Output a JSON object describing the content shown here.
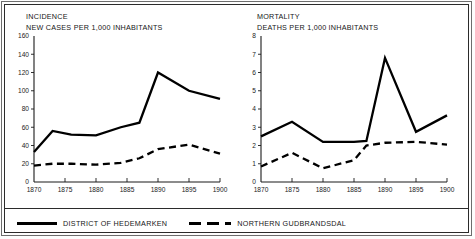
{
  "figure": {
    "legend": {
      "series": [
        {
          "key": "hedemarken",
          "label": "DISTRICT OF HEDEMARKEN",
          "style": "solid"
        },
        {
          "key": "gudbrandsdal",
          "label": "NORTHERN GUDBRANDSDAL",
          "style": "dashed"
        }
      ]
    }
  },
  "chart_data": [
    {
      "id": "incidence",
      "type": "line",
      "title": "INCIDENCE",
      "subtitle": "NEW CASES PER 1,000 INHABITANTS",
      "xlabel": "",
      "ylabel": "NEW CASES PER 1,000 INHABITANTS",
      "grid": false,
      "legend_position": "bottom",
      "xlim": [
        1870,
        1900
      ],
      "ylim": [
        0,
        160
      ],
      "xticks": [
        1870,
        1875,
        1880,
        1885,
        1890,
        1895,
        1900
      ],
      "yticks": [
        0,
        20,
        40,
        60,
        80,
        100,
        120,
        140,
        160
      ],
      "xticklabels": [
        "1870",
        "1875",
        "1880",
        "1885",
        "1890",
        "1895",
        "1900"
      ],
      "yticklabels": [
        "0",
        "20",
        "40",
        "60",
        "80",
        "100",
        "120",
        "140",
        "160"
      ],
      "x": [
        1870,
        1873,
        1876,
        1880,
        1884,
        1887,
        1890,
        1895,
        1900
      ],
      "series": [
        {
          "name": "DISTRICT OF HEDEMARKEN",
          "style": "solid",
          "values": [
            33,
            56,
            52,
            51,
            60,
            65,
            120,
            100,
            91
          ]
        },
        {
          "name": "NORTHERN GUDBRANDSDAL",
          "style": "dashed",
          "values": [
            18,
            20,
            20,
            19,
            21,
            26,
            36,
            41,
            31
          ]
        }
      ]
    },
    {
      "id": "mortality",
      "type": "line",
      "title": "MORTALITY",
      "subtitle": "DEATHS PER 1,000 INHABITANTS",
      "xlabel": "",
      "ylabel": "DEATHS PER 1,000 INHABITANTS",
      "grid": false,
      "legend_position": "bottom",
      "xlim": [
        1870,
        1900
      ],
      "ylim": [
        0,
        8
      ],
      "xticks": [
        1870,
        1875,
        1880,
        1885,
        1890,
        1895,
        1900
      ],
      "yticks": [
        0,
        1,
        2,
        3,
        4,
        5,
        6,
        7,
        8
      ],
      "xticklabels": [
        "1870",
        "1875",
        "1880",
        "1885",
        "1890",
        "1895",
        "1900"
      ],
      "yticklabels": [
        "0",
        "1",
        "2",
        "3",
        "4",
        "5",
        "6",
        "7",
        "8"
      ],
      "x": [
        1870,
        1875,
        1880,
        1885,
        1887,
        1890,
        1895,
        1900
      ],
      "series": [
        {
          "name": "DISTRICT OF HEDEMARKEN",
          "style": "solid",
          "values": [
            2.5,
            3.3,
            2.2,
            2.2,
            2.25,
            6.8,
            2.75,
            3.65
          ]
        },
        {
          "name": "NORTHERN GUDBRANDSDAL",
          "style": "dashed",
          "values": [
            0.85,
            1.6,
            0.75,
            1.2,
            2.0,
            2.15,
            2.2,
            2.05
          ]
        }
      ]
    }
  ]
}
